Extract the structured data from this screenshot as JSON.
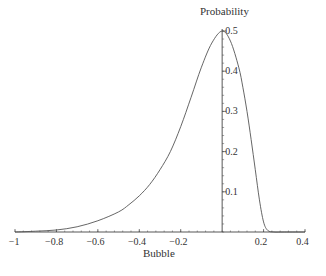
{
  "chart_data": {
    "type": "line",
    "title": "",
    "xlabel": "Bubble",
    "ylabel": "Probability",
    "xlim": [
      -1,
      0.4
    ],
    "ylim": [
      0,
      0.5
    ],
    "grid": false,
    "legend": null,
    "x_ticks": [
      -1,
      -0.8,
      -0.6,
      -0.4,
      -0.2,
      0.2,
      0.4
    ],
    "x_tick_labels": [
      "−1",
      "−0.8",
      "−0.6",
      "−0.4",
      "−0.2",
      "0.2",
      "0.4"
    ],
    "y_ticks": [
      0.1,
      0.2,
      0.3,
      0.4,
      0.5
    ],
    "y_tick_labels": [
      "0.1",
      "0.2",
      "0.3",
      "0.4",
      "0.5"
    ],
    "series": [
      {
        "name": "density",
        "x": [
          -1.0,
          -0.9,
          -0.8,
          -0.7,
          -0.6,
          -0.5,
          -0.45,
          -0.4,
          -0.35,
          -0.3,
          -0.25,
          -0.2,
          -0.15,
          -0.1,
          -0.05,
          0.0,
          0.04,
          0.08,
          0.1,
          0.12,
          0.14,
          0.16,
          0.18,
          0.2,
          0.22,
          0.25,
          0.3,
          0.4
        ],
        "y": [
          0.0,
          0.002,
          0.005,
          0.013,
          0.028,
          0.05,
          0.068,
          0.09,
          0.118,
          0.155,
          0.2,
          0.262,
          0.335,
          0.41,
          0.47,
          0.5,
          0.475,
          0.41,
          0.36,
          0.3,
          0.23,
          0.155,
          0.08,
          0.025,
          0.004,
          0.0,
          0.0,
          0.0
        ]
      }
    ]
  },
  "axes": {
    "x_label": "Bubble",
    "y_label": "Probability"
  }
}
